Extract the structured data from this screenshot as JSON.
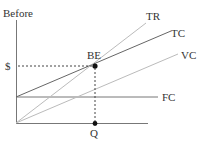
{
  "diagram": {
    "type": "break-even chart",
    "y_axis_label": "Before",
    "price_label": "$",
    "quantity_label": "Q",
    "break_even_label": "BE",
    "lines": [
      {
        "name": "TR",
        "label": "TR",
        "color": "#b8b8b8"
      },
      {
        "name": "TC",
        "label": "TC",
        "color": "#666666"
      },
      {
        "name": "VC",
        "label": "VC",
        "color": "#b8b8b8"
      },
      {
        "name": "FC",
        "label": "FC",
        "color": "#666666"
      }
    ],
    "axis_color": "#777777",
    "point_color": "#111111"
  }
}
